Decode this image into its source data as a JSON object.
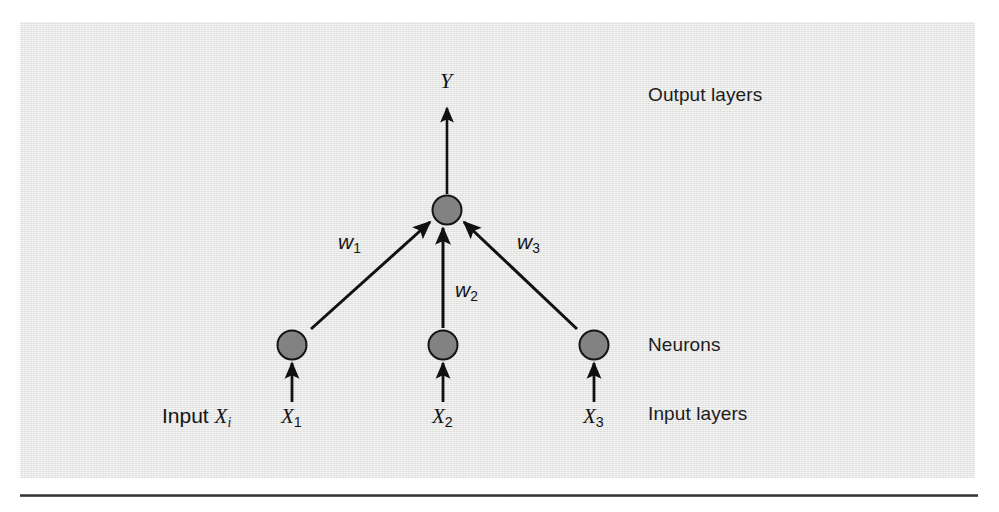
{
  "figure": {
    "type": "neural-network-diagram",
    "panel_color": "#e4e4e3",
    "node_fill_color": "#808080",
    "node_stroke_color": "#1a1a1a",
    "line_color": "#111111",
    "side_labels": {
      "output": "Output layers",
      "neurons": "Neurons",
      "input": "Input layers"
    },
    "input_caption": {
      "prefix": "Input ",
      "variable": "X",
      "subscript": "i"
    },
    "output": {
      "variable": "Y"
    },
    "nodes": {
      "output_node": {
        "id": "Y-node",
        "cx": 427,
        "cy": 188
      },
      "input_nodes": [
        {
          "id": "X1-node",
          "cx": 272,
          "cy": 323,
          "label_var": "X",
          "label_sub": "1"
        },
        {
          "id": "X2-node",
          "cx": 423,
          "cy": 323,
          "label_var": "X",
          "label_sub": "2"
        },
        {
          "id": "X3-node",
          "cx": 574,
          "cy": 323,
          "label_var": "X",
          "label_sub": "3"
        }
      ]
    },
    "weights": [
      {
        "id": "w1",
        "variable": "w",
        "subscript": "1"
      },
      {
        "id": "w2",
        "variable": "w",
        "subscript": "2"
      },
      {
        "id": "w3",
        "variable": "w",
        "subscript": "3"
      }
    ],
    "input_labels": [
      {
        "variable": "X",
        "subscript": "1"
      },
      {
        "variable": "X",
        "subscript": "2"
      },
      {
        "variable": "X",
        "subscript": "3"
      }
    ]
  }
}
